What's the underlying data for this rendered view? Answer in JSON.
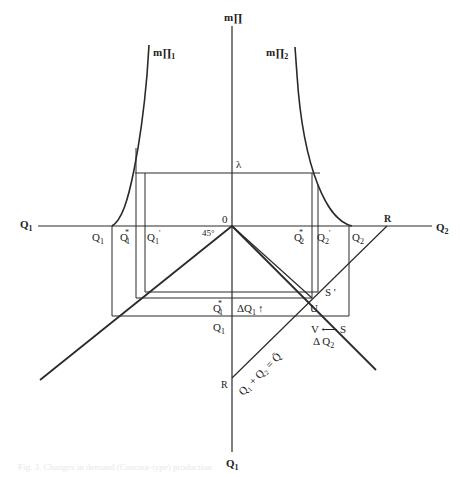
{
  "figure": {
    "axes": {
      "vertical_top_label": "m∏",
      "vertical_bottom_label": "Q",
      "vertical_bottom_sub": "1",
      "horizontal_left_label": "Q",
      "horizontal_left_sub": "1",
      "horizontal_right_label": "Q",
      "horizontal_right_sub": "2",
      "origin_label": "0",
      "angle_label": "45°"
    },
    "curves": {
      "left": {
        "label": "m∏",
        "sub": "1"
      },
      "right": {
        "label": "m∏",
        "sub": "2"
      }
    },
    "lambda_label": "λ",
    "axis_tick_labels": {
      "q1": {
        "main": "Q",
        "sub": "1"
      },
      "q1_star": {
        "main": "Q",
        "sub": "1",
        "sup": "*"
      },
      "q1_prime": {
        "main": "Q",
        "sub": "1",
        "sup": "'"
      },
      "q2_star": {
        "main": "Q",
        "sub": "2",
        "sup": "*"
      },
      "q2_prime": {
        "main": "Q",
        "sub": "2",
        "sup": "'"
      },
      "q2": {
        "main": "Q",
        "sub": "2"
      },
      "r_top": "R"
    },
    "lower_labels": {
      "q1_star": {
        "main": "Q",
        "sub": "1",
        "sup": "*"
      },
      "delta_q1": {
        "main": "ΔQ",
        "sub": "1",
        "arrow": "↑"
      },
      "q1": {
        "main": "Q",
        "sub": "1"
      },
      "s_prime": "S '",
      "u": "U",
      "v_from_s": "V ⟵ S",
      "delta_q2": {
        "main": "Δ Q",
        "sub": "2"
      },
      "r_bottom": "R",
      "budget_line": "Q₁ + Q₂ = Q̄"
    },
    "caption": "Fig. 3. Changes in demand (Cournot-type) production"
  }
}
